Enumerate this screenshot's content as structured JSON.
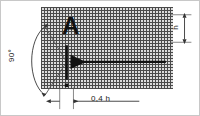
{
  "drawing": {
    "type": "engineering-detail",
    "surface_label": "A",
    "angle_label": "90°",
    "height_label": "h",
    "offset_label": "0,4 h",
    "colors": {
      "line": "#111111",
      "hatch": "#4a4a4a",
      "hatch_fill": "#dcdcdc",
      "thin_line": "#555555",
      "background": "#ffffff",
      "frame": "#c8c8c8"
    },
    "geometry": {
      "body_x": 40,
      "body_y": 6,
      "body_w": 132,
      "body_h": 82,
      "vertex_x": 66,
      "vertex_y": 62,
      "arrow_end_x": 167,
      "arc_top_x": 44,
      "arc_top_y": 26,
      "arc_bottom_x": 44,
      "arc_bottom_y": 96,
      "dim_h_top_y": 14,
      "dim_h_bottom_y": 42,
      "dim_h_line_x": 186,
      "dim_bottom_y": 102,
      "dim_left_x": 59,
      "dim_right_x": 73
    }
  }
}
